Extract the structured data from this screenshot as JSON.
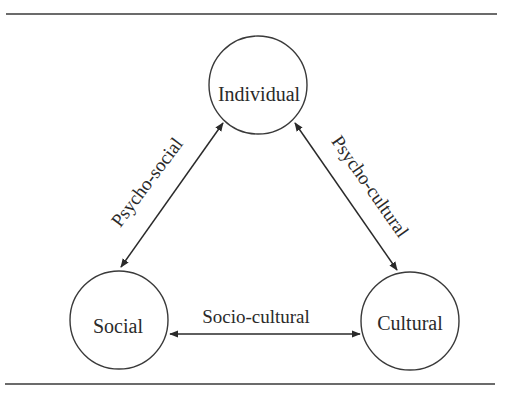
{
  "diagram": {
    "type": "triangle-relationship",
    "colors": {
      "line": "#2a2a2a",
      "circle_stroke": "#3a3a3a",
      "background": "#ffffff"
    },
    "nodes": [
      {
        "id": "individual",
        "label": "Individual",
        "cx": 258,
        "cy": 85,
        "r": 49
      },
      {
        "id": "social",
        "label": "Social",
        "cx": 119,
        "cy": 320,
        "r": 49
      },
      {
        "id": "cultural",
        "label": "Cultural",
        "cx": 410,
        "cy": 321,
        "r": 49
      }
    ],
    "edges": [
      {
        "id": "psycho-social",
        "label": "Psycho-social",
        "from": "individual",
        "to": "social",
        "bidirectional": true
      },
      {
        "id": "psycho-cultural",
        "label": "Psycho-cultural",
        "from": "individual",
        "to": "cultural",
        "bidirectional": true
      },
      {
        "id": "socio-cultural",
        "label": "Socio-cultural",
        "from": "social",
        "to": "cultural",
        "bidirectional": true
      }
    ]
  }
}
